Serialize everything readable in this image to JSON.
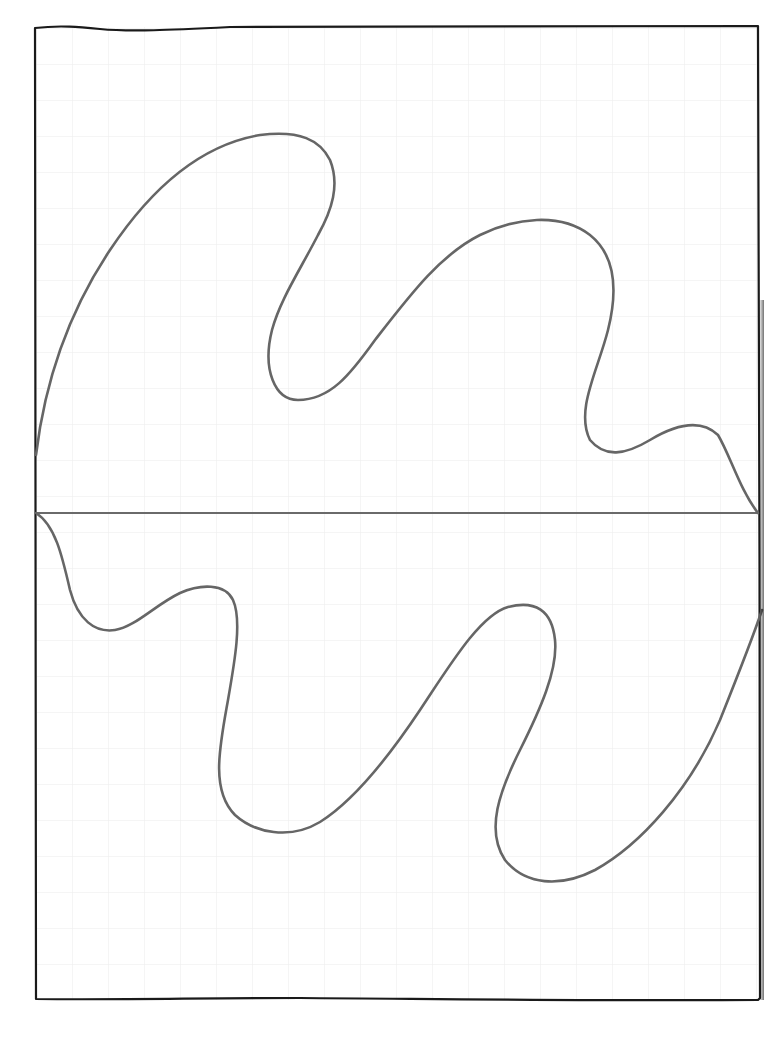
{
  "drawing": {
    "description": "Hand-drawn wavy closed curve on grid paper, split by a horizontal baseline",
    "paper": {
      "background_color": "#ffffff",
      "grid_color": "#ececec",
      "grid_spacing_px": 36
    },
    "frame": {
      "stroke_color": "#1a1a1a",
      "left": 36,
      "top": 27,
      "right": 758,
      "bottom": 1000
    },
    "baseline": {
      "stroke_color": "#6a6a6a",
      "y": 513,
      "x1": 36,
      "x2": 758
    },
    "curve": {
      "stroke_color": "#666666",
      "upper_lobes": 2,
      "lower_lobes": 2
    }
  }
}
